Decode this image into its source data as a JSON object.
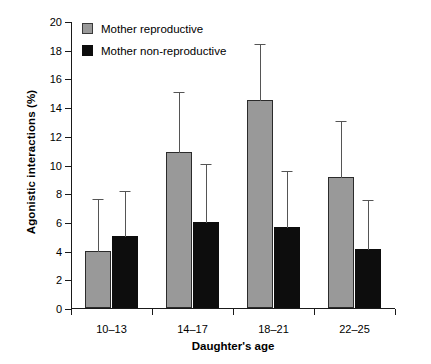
{
  "chart_data": {
    "type": "bar",
    "title": "",
    "xlabel": "Daughter's age",
    "ylabel": "Agonistic interactions (%)",
    "categories": [
      "10–13",
      "14–17",
      "18–21",
      "22–25"
    ],
    "ylim": [
      0,
      20
    ],
    "yticks": [
      0,
      2,
      4,
      6,
      8,
      10,
      12,
      14,
      16,
      18,
      20
    ],
    "ytick_labels": [
      "0",
      "2",
      "4",
      "6",
      "8",
      "10",
      "12",
      "14",
      "16",
      "18",
      "20"
    ],
    "grid": false,
    "legend_position": "top-left",
    "error_bars": "upper only",
    "series": [
      {
        "name": "Mother reproductive",
        "color": "#999999",
        "values": [
          4.0,
          10.9,
          14.5,
          9.1
        ],
        "err_upper": [
          3.7,
          4.2,
          4.0,
          4.0
        ],
        "err_top": [
          7.7,
          15.1,
          18.5,
          13.1
        ]
      },
      {
        "name": "Mother non-reproductive",
        "color": "#0d0d0d",
        "values": [
          5.0,
          6.0,
          5.65,
          4.1
        ],
        "err_upper": [
          3.2,
          4.1,
          3.95,
          3.5
        ],
        "err_top": [
          8.2,
          10.1,
          9.6,
          7.6
        ]
      }
    ]
  },
  "legend": {
    "items": [
      {
        "label": "Mother reproductive",
        "swatch": "gray"
      },
      {
        "label": "Mother non-reproductive",
        "swatch": "black"
      }
    ]
  },
  "colors": {
    "gray_bar": "#999999",
    "black_bar": "#0d0d0d",
    "axis": "#1a1a1a",
    "error_bar": "#555555",
    "background": "#ffffff"
  }
}
